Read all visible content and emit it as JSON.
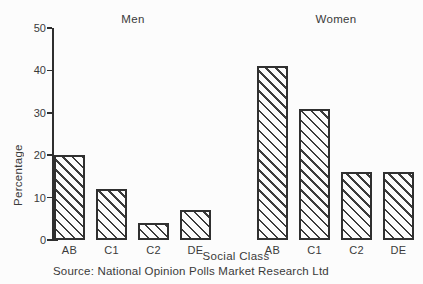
{
  "chart_data": {
    "type": "bar",
    "categories": [
      "AB",
      "C1",
      "C2",
      "DE"
    ],
    "series": [
      {
        "name": "Men",
        "values": [
          20,
          12,
          4,
          7
        ]
      },
      {
        "name": "Women",
        "values": [
          41,
          31,
          16,
          16
        ]
      }
    ],
    "ylabel": "Percentage",
    "xlabel": "Social Class",
    "yticks": [
      0,
      10,
      20,
      30,
      40,
      50
    ],
    "ylim": [
      0,
      50
    ],
    "grid": false,
    "legend_position": "none",
    "bar_fill": "diagonal-hatch",
    "source": "Source: National Opinion Polls Market Research Ltd"
  },
  "colors": {
    "ink": "#3a3a3a",
    "background": "#fcfcfc"
  }
}
